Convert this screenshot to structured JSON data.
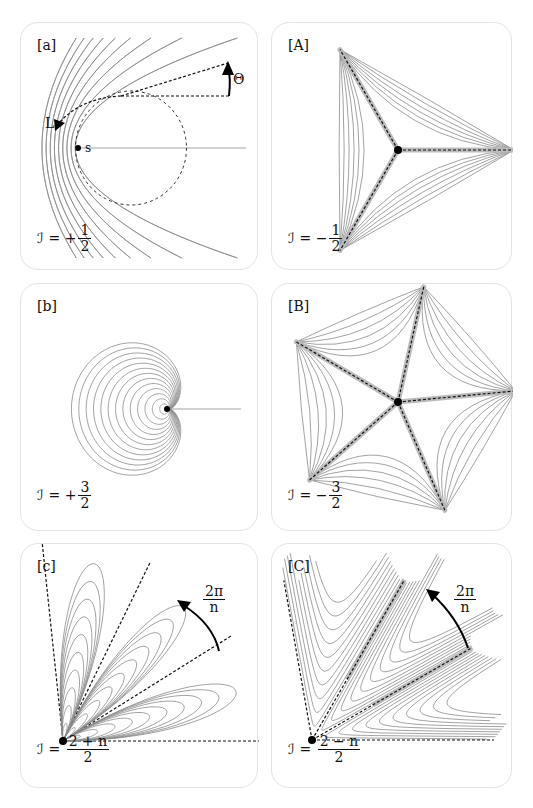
{
  "panels": {
    "a": {
      "tag": "[a]",
      "formula": {
        "lhs": "ℐ",
        "eq": "=",
        "sign": "+",
        "num": "1",
        "den": "2"
      },
      "labels": {
        "theta": "Θ",
        "L": "L",
        "s": "s"
      },
      "index_value": 0.5
    },
    "A": {
      "tag": "[A]",
      "formula": {
        "lhs": "ℐ",
        "eq": "=",
        "sign": "−",
        "num": "1",
        "den": "2"
      },
      "index_value": -0.5,
      "arms": 3
    },
    "b": {
      "tag": "[b]",
      "formula": {
        "lhs": "ℐ",
        "eq": "=",
        "sign": "+",
        "num": "3",
        "den": "2"
      },
      "index_value": 1.5
    },
    "B": {
      "tag": "[B]",
      "formula": {
        "lhs": "ℐ",
        "eq": "=",
        "sign": "−",
        "num": "3",
        "den": "2"
      },
      "index_value": -1.5,
      "arms": 5
    },
    "c": {
      "tag": "[c]",
      "formula": {
        "lhs": "ℐ",
        "eq": "=",
        "sign": "",
        "num": "2 + n",
        "den": "2"
      },
      "angle_label": {
        "num": "2π",
        "den": "n"
      }
    },
    "C": {
      "tag": "[C]",
      "formula": {
        "lhs": "ℐ",
        "eq": "=",
        "sign": "",
        "num": "2 − n",
        "den": "2"
      },
      "angle_label": {
        "num": "2π",
        "den": "n"
      }
    }
  }
}
